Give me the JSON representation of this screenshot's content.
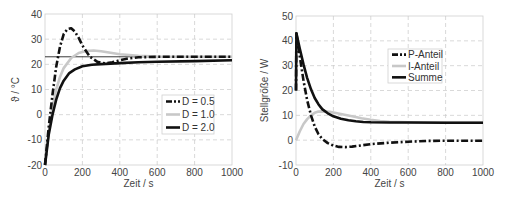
{
  "chart_data": [
    {
      "type": "line",
      "title": "",
      "xlabel": "Zeit / s",
      "ylabel": "ϑ / °C",
      "xlim": [
        0,
        1000
      ],
      "ylim": [
        -20,
        40
      ],
      "xticks": [
        0,
        200,
        400,
        600,
        800,
        1000
      ],
      "yticks": [
        -20,
        -10,
        0,
        10,
        20,
        30,
        40
      ],
      "grid": true,
      "legend_position": "center-right",
      "reference_line": {
        "y": 23,
        "label": "setpoint"
      },
      "series": [
        {
          "name": "D = 0.5",
          "style": "dash-dot",
          "color": "#111111",
          "x": [
            0,
            20,
            40,
            60,
            80,
            100,
            120,
            140,
            160,
            180,
            200,
            240,
            280,
            320,
            360,
            400,
            450,
            500,
            600,
            800,
            1000
          ],
          "y": [
            -20,
            -5,
            8,
            19,
            27,
            32,
            34,
            34.3,
            33,
            30.5,
            27.5,
            23,
            21,
            20.4,
            20.8,
            21.6,
            22.4,
            22.8,
            23,
            23,
            23
          ]
        },
        {
          "name": "D = 1.0",
          "style": "solid",
          "color": "#c8c8c8",
          "x": [
            0,
            20,
            40,
            60,
            80,
            100,
            140,
            180,
            220,
            260,
            300,
            350,
            400,
            500,
            600,
            800,
            1000
          ],
          "y": [
            -20,
            -7,
            3,
            10,
            15,
            18.5,
            22.5,
            24.5,
            25.3,
            25.5,
            25.2,
            24.6,
            24,
            23.4,
            23.1,
            23,
            23
          ]
        },
        {
          "name": "D = 2.0",
          "style": "solid",
          "color": "#111111",
          "x": [
            0,
            20,
            40,
            60,
            80,
            100,
            130,
            160,
            200,
            250,
            300,
            400,
            500,
            600,
            800,
            1000
          ],
          "y": [
            -20,
            -8,
            0,
            6,
            10.5,
            13.5,
            16.5,
            18,
            19.2,
            19.8,
            20.1,
            20.5,
            20.8,
            21,
            21.3,
            21.6
          ]
        }
      ]
    },
    {
      "type": "line",
      "title": "",
      "xlabel": "Zeit / s",
      "ylabel": "Stellgröße / W",
      "xlim": [
        0,
        1000
      ],
      "ylim": [
        -10,
        50
      ],
      "xticks": [
        0,
        200,
        400,
        600,
        800,
        1000
      ],
      "yticks": [
        -10,
        0,
        10,
        20,
        30,
        40,
        50
      ],
      "grid": true,
      "legend_position": "upper-right",
      "series": [
        {
          "name": "P-Anteil",
          "style": "dash-dot",
          "color": "#111111",
          "x": [
            0,
            2,
            20,
            40,
            60,
            80,
            100,
            120,
            140,
            170,
            200,
            230,
            262,
            300,
            350,
            400,
            500,
            600,
            700,
            800,
            1000
          ],
          "y": [
            20,
            43,
            34,
            24,
            16,
            10,
            5.5,
            2.5,
            0.5,
            -1.2,
            -2.2,
            -2.7,
            -2.8,
            -2.6,
            -2.1,
            -1.6,
            -1.0,
            -0.6,
            -0.3,
            -0.2,
            -0.2
          ]
        },
        {
          "name": "I-Anteil",
          "style": "solid",
          "color": "#c8c8c8",
          "x": [
            0,
            20,
            40,
            60,
            80,
            100,
            120,
            145,
            180,
            220,
            260,
            300,
            350,
            400,
            450,
            500,
            600,
            800,
            1000
          ],
          "y": [
            0,
            3.5,
            6.5,
            8.5,
            10,
            11,
            11.5,
            11.6,
            11.4,
            10.8,
            10.2,
            9.6,
            8.8,
            8.2,
            7.7,
            7.4,
            7.2,
            7.1,
            7.1
          ]
        },
        {
          "name": "Summe",
          "style": "solid",
          "color": "#111111",
          "x": [
            0,
            2,
            20,
            40,
            60,
            80,
            100,
            120,
            140,
            170,
            200,
            240,
            280,
            320,
            360,
            400,
            500,
            600,
            800,
            1000
          ],
          "y": [
            20,
            43,
            37,
            30.5,
            25,
            20.5,
            17,
            14.5,
            12.5,
            10.8,
            9.6,
            8.6,
            8,
            7.6,
            7.3,
            7.2,
            7.1,
            7.1,
            7.0,
            7.0
          ]
        }
      ]
    }
  ]
}
